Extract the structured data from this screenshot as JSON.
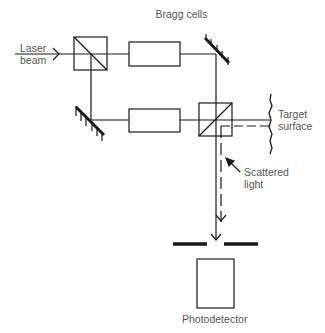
{
  "diagram": {
    "title": "Bragg cells",
    "labels": {
      "laser_line1": "Laser",
      "laser_line2": "beam",
      "target_line1": "Target",
      "target_line2": "surface",
      "scattered_line1": "Scattered",
      "scattered_line2": "light",
      "photodetector": "Photodetector"
    },
    "components": [
      "laser-input-arrow",
      "beam-splitter-1",
      "bragg-cell-1",
      "mirror-top-right",
      "mirror-bottom-left",
      "bragg-cell-2",
      "beam-splitter-2",
      "target-surface",
      "scattered-light-path",
      "aperture",
      "photodetector"
    ],
    "colors": {
      "line": "#1a1a1a",
      "text": "#555555",
      "background": "#ffffff"
    }
  }
}
